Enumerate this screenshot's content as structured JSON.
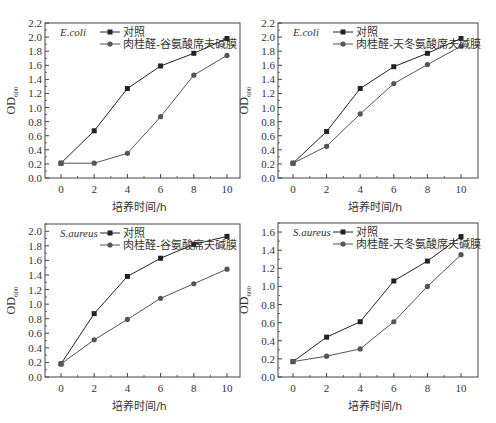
{
  "chart_data": [
    {
      "type": "line",
      "id": "ecoli-glutamine",
      "organism_label": "E.coli",
      "xlabel": "培养时间/h",
      "ylabel": "OD600",
      "ylabel_main": "OD",
      "ylabel_sub": "600",
      "x": [
        0,
        2,
        4,
        6,
        8,
        10
      ],
      "xticks": [
        0,
        2,
        4,
        6,
        8,
        10
      ],
      "xlim": [
        -1,
        11
      ],
      "yticks": [
        0.0,
        0.2,
        0.4,
        0.6,
        0.8,
        1.0,
        1.2,
        1.4,
        1.6,
        1.8,
        2.0,
        2.2
      ],
      "ylim": [
        0,
        2.2
      ],
      "grid": false,
      "legend_position": "top",
      "series": [
        {
          "name": "对照",
          "marker": "square",
          "color": "#222222",
          "values": [
            0.21,
            0.67,
            1.27,
            1.59,
            1.77,
            1.98
          ]
        },
        {
          "name": "肉桂醛-谷氨酸席夫碱膜",
          "marker": "circle",
          "color": "#555555",
          "values": [
            0.21,
            0.21,
            0.35,
            0.87,
            1.46,
            1.74
          ]
        }
      ]
    },
    {
      "type": "line",
      "id": "ecoli-asparagine",
      "organism_label": "E.coli",
      "xlabel": "培养时间/h",
      "ylabel": "OD600",
      "ylabel_main": "OD",
      "ylabel_sub": "600",
      "x": [
        0,
        2,
        4,
        6,
        8,
        10
      ],
      "xticks": [
        0,
        2,
        4,
        6,
        8,
        10
      ],
      "xlim": [
        -1,
        11
      ],
      "yticks": [
        0.0,
        0.2,
        0.4,
        0.6,
        0.8,
        1.0,
        1.2,
        1.4,
        1.6,
        1.8,
        2.0,
        2.2
      ],
      "ylim": [
        0,
        2.2
      ],
      "grid": false,
      "legend_position": "top",
      "series": [
        {
          "name": "对照",
          "marker": "square",
          "color": "#222222",
          "values": [
            0.21,
            0.66,
            1.27,
            1.58,
            1.77,
            1.98
          ]
        },
        {
          "name": "肉桂醛-天冬氨酸席夫碱膜",
          "marker": "circle",
          "color": "#555555",
          "values": [
            0.21,
            0.45,
            0.91,
            1.34,
            1.61,
            1.87
          ]
        }
      ]
    },
    {
      "type": "line",
      "id": "saureus-glutamine",
      "organism_label": "S.aureus",
      "xlabel": "培养时间/h",
      "ylabel": "OD600",
      "ylabel_main": "OD",
      "ylabel_sub": "600",
      "x": [
        0,
        2,
        4,
        6,
        8,
        10
      ],
      "xticks": [
        0,
        2,
        4,
        6,
        8,
        10
      ],
      "xlim": [
        -1,
        11
      ],
      "yticks": [
        0.0,
        0.2,
        0.4,
        0.6,
        0.8,
        1.0,
        1.2,
        1.4,
        1.6,
        1.8,
        2.0
      ],
      "ylim": [
        0,
        2.1
      ],
      "grid": false,
      "legend_position": "top",
      "series": [
        {
          "name": "对照",
          "marker": "square",
          "color": "#222222",
          "values": [
            0.18,
            0.87,
            1.38,
            1.63,
            1.82,
            1.93
          ]
        },
        {
          "name": "肉桂醛-谷氨酸席夫碱膜",
          "marker": "circle",
          "color": "#555555",
          "values": [
            0.18,
            0.51,
            0.79,
            1.08,
            1.28,
            1.48
          ]
        }
      ]
    },
    {
      "type": "line",
      "id": "saureus-asparagine",
      "organism_label": "S.aureus",
      "xlabel": "培养时间/h",
      "ylabel": "OD600",
      "ylabel_main": "OD",
      "ylabel_sub": "600",
      "x": [
        0,
        2,
        4,
        6,
        8,
        10
      ],
      "xticks": [
        0,
        2,
        4,
        6,
        8,
        10
      ],
      "xlim": [
        -1,
        11
      ],
      "yticks": [
        0.0,
        0.2,
        0.4,
        0.6,
        0.8,
        1.0,
        1.2,
        1.4,
        1.6
      ],
      "ylim": [
        0,
        1.7
      ],
      "grid": false,
      "legend_position": "top",
      "series": [
        {
          "name": "对照",
          "marker": "square",
          "color": "#222222",
          "values": [
            0.17,
            0.44,
            0.61,
            1.06,
            1.28,
            1.55
          ]
        },
        {
          "name": "肉桂醛-天冬氨酸席夫碱膜",
          "marker": "circle",
          "color": "#555555",
          "values": [
            0.17,
            0.23,
            0.31,
            0.61,
            1.0,
            1.35
          ]
        }
      ]
    }
  ]
}
